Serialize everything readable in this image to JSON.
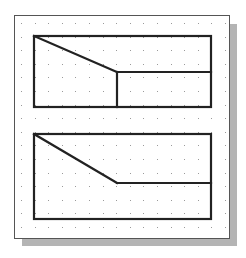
{
  "colors": {
    "background": "#ffffff",
    "frame_fill": "#ffffff",
    "frame_stroke": "#555555",
    "shadow": "#b4b4b4",
    "grid_dot": "#9a9a9a",
    "line": "#222222"
  },
  "frame": {
    "x": 14,
    "y": 15,
    "width": 215,
    "height": 223
  },
  "shadow": {
    "x": 22,
    "y": 24,
    "width": 215,
    "height": 222
  },
  "grid": {
    "origin_x": 21,
    "origin_y": 23,
    "step": 13.6,
    "cols": 16,
    "rows": 16
  },
  "shapes": [
    {
      "name": "top-view-rectangle",
      "rect": {
        "x": 34,
        "y": 36,
        "width": 177,
        "height": 71
      },
      "lines": [
        {
          "name": "diagonal-edge",
          "x1": 34,
          "y1": 36,
          "x2": 117,
          "y2": 72
        },
        {
          "name": "horizontal-edge",
          "x1": 117,
          "y1": 72,
          "x2": 211,
          "y2": 72
        },
        {
          "name": "vertical-edge",
          "x1": 117,
          "y1": 72,
          "x2": 117,
          "y2": 107
        }
      ]
    },
    {
      "name": "front-view-rectangle",
      "rect": {
        "x": 34,
        "y": 134,
        "width": 177,
        "height": 85
      },
      "lines": [
        {
          "name": "diagonal-edge",
          "x1": 34,
          "y1": 134,
          "x2": 117,
          "y2": 183
        },
        {
          "name": "horizontal-edge",
          "x1": 117,
          "y1": 183,
          "x2": 211,
          "y2": 183
        }
      ]
    }
  ]
}
